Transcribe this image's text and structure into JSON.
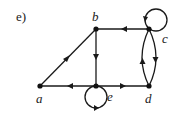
{
  "part_label": "e)",
  "graph": {
    "type": "directed",
    "nodes": [
      {
        "id": "a",
        "label": "a",
        "x": 40,
        "y": 86,
        "label_x": 34,
        "label_y": 92
      },
      {
        "id": "b",
        "label": "b",
        "x": 96,
        "y": 29,
        "label_x": 91,
        "label_y": 11
      },
      {
        "id": "c",
        "label": "c",
        "x": 149,
        "y": 29,
        "label_x": 162,
        "label_y": 32
      },
      {
        "id": "d",
        "label": "d",
        "x": 149,
        "y": 86,
        "label_x": 144,
        "label_y": 92
      },
      {
        "id": "e",
        "label": "e",
        "x": 96,
        "y": 86,
        "label_x": 107,
        "label_y": 91
      }
    ],
    "edges": [
      {
        "from": "a",
        "to": "b"
      },
      {
        "from": "c",
        "to": "b"
      },
      {
        "from": "b",
        "to": "e"
      },
      {
        "from": "e",
        "to": "a"
      },
      {
        "from": "e",
        "to": "d"
      },
      {
        "from": "d",
        "to": "c"
      },
      {
        "from": "c",
        "to": "d"
      },
      {
        "from": "c",
        "to": "c"
      },
      {
        "from": "e",
        "to": "e"
      }
    ]
  },
  "colors": {
    "stroke": "#1a1a1a",
    "background": "#ffffff"
  }
}
